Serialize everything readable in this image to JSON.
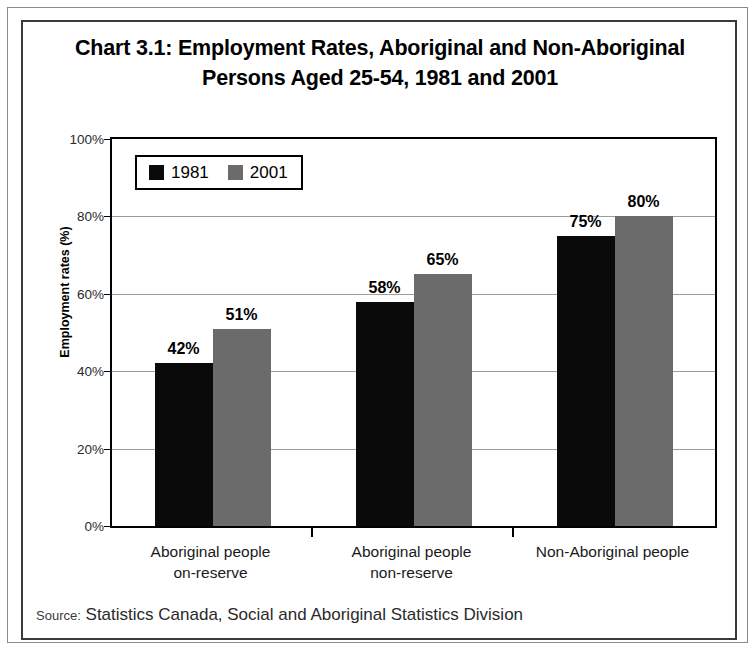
{
  "chart_data": {
    "type": "bar",
    "title": "Chart 3.1:  Employment Rates, Aboriginal and Non-Aboriginal Persons Aged 25-54, 1981 and 2001",
    "title_line1": "Chart 3.1:  Employment Rates, Aboriginal and Non-Aboriginal",
    "title_line2": "Persons Aged 25-54, 1981 and 2001",
    "xlabel": "",
    "ylabel": "Employment rates (%)",
    "ylim": [
      0,
      100
    ],
    "ytick_labels": [
      "0%",
      "20%",
      "40%",
      "60%",
      "80%",
      "100%"
    ],
    "ytick_values": [
      0,
      20,
      40,
      60,
      80,
      100
    ],
    "grid": true,
    "legend_position": "top-left-inside",
    "categories": [
      {
        "line1": "Aboriginal people",
        "line2": "on-reserve"
      },
      {
        "line1": "Aboriginal people",
        "line2": "non-reserve"
      },
      {
        "line1": "Non-Aboriginal people",
        "line2": ""
      }
    ],
    "series": [
      {
        "name": "1981",
        "color": "#0a0a0a",
        "values": [
          42,
          58,
          75
        ],
        "data_labels": [
          "42%",
          "58%",
          "75%"
        ]
      },
      {
        "name": "2001",
        "color": "#6b6b6b",
        "values": [
          51,
          65,
          80
        ],
        "data_labels": [
          "51%",
          "65%",
          "80%"
        ]
      }
    ]
  },
  "source": {
    "prefix": "Source:",
    "text": "Statistics Canada, Social and Aboriginal Statistics Division"
  },
  "colors": {
    "series_1981": "#0a0a0a",
    "series_2001": "#6b6b6b",
    "axis": "#000000",
    "gridline": "#9d9d9d",
    "frame_outer": "#8a8a8a",
    "frame_inner": "#3a3a3a"
  }
}
